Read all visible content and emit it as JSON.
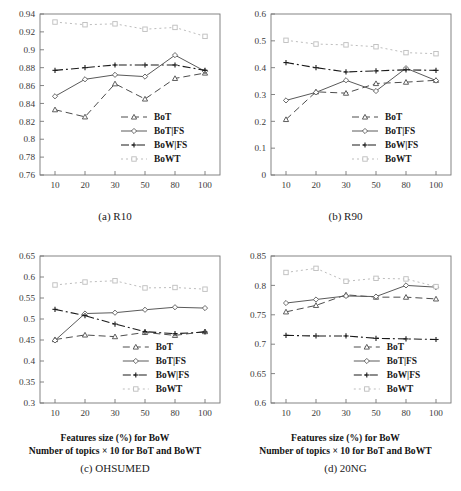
{
  "figure": {
    "panels": [
      {
        "id": "r10",
        "caption": "(a) R10",
        "xtitle_line1": "",
        "xtitle_line2": ""
      },
      {
        "id": "r90",
        "caption": "(b) R90",
        "xtitle_line1": "",
        "xtitle_line2": ""
      },
      {
        "id": "ohsumed",
        "caption": "(c) OHSUMED",
        "xtitle_line1": "Features size (%) for BoW",
        "xtitle_line2": "Number of topics × 10 for BoT and BoWT"
      },
      {
        "id": "20ng",
        "caption": "(d) 20NG",
        "xtitle_line1": "Features size (%) for BoW",
        "xtitle_line2": "Number of topics × 10 for BoT and BoWT"
      }
    ]
  },
  "series_style": {
    "BoT": {
      "color": "#4d4d4d",
      "marker": "triangle",
      "dash": "7,4",
      "width": 1.0
    },
    "BoT|FS": {
      "color": "#5a5a5a",
      "marker": "diamond",
      "dash": "",
      "width": 1.0
    },
    "BoW|FS": {
      "color": "#1a1a1a",
      "marker": "plus",
      "dash": "8,3,2,3",
      "width": 1.1
    },
    "BoWT": {
      "color": "#bdbdbd",
      "marker": "square",
      "dash": "2,3",
      "width": 1.0
    }
  },
  "legend": {
    "entries": [
      "BoT",
      "BoT|FS",
      "BoW|FS",
      "BoWT"
    ]
  },
  "chart_data": [
    {
      "type": "line",
      "title": "(a) R10",
      "xlabel": "",
      "ylabel": "",
      "categories": [
        "10",
        "20",
        "30",
        "50",
        "80",
        "100"
      ],
      "x": [
        10,
        20,
        30,
        50,
        80,
        100
      ],
      "xticklabels": [
        "10",
        "20",
        "30",
        "50",
        "80",
        "100"
      ],
      "yticklabels": [
        "0.76",
        "0.78",
        "0.8",
        "0.82",
        "0.84",
        "0.86",
        "0.88",
        "0.9",
        "0.92",
        "0.94"
      ],
      "ylim": [
        0.76,
        0.94
      ],
      "ytick_step": 0.02,
      "grid": false,
      "legend_position": "lower-right-inside",
      "series": [
        {
          "name": "BoT",
          "values": [
            0.833,
            0.825,
            0.862,
            0.845,
            0.868,
            0.874
          ]
        },
        {
          "name": "BoT|FS",
          "values": [
            0.848,
            0.867,
            0.872,
            0.87,
            0.894,
            0.876
          ]
        },
        {
          "name": "BoW|FS",
          "values": [
            0.877,
            0.88,
            0.883,
            0.883,
            0.883,
            0.877
          ]
        },
        {
          "name": "BoWT",
          "values": [
            0.931,
            0.928,
            0.929,
            0.923,
            0.925,
            0.915
          ]
        }
      ]
    },
    {
      "type": "line",
      "title": "(b) R90",
      "xlabel": "",
      "ylabel": "",
      "categories": [
        "10",
        "20",
        "30",
        "50",
        "80",
        "100"
      ],
      "x": [
        10,
        20,
        30,
        50,
        80,
        100
      ],
      "xticklabels": [
        "10",
        "20",
        "30",
        "50",
        "80",
        "100"
      ],
      "yticklabels": [
        "0",
        "0.1",
        "0.2",
        "0.3",
        "0.4",
        "0.5",
        "0.6"
      ],
      "ylim": [
        0,
        0.6
      ],
      "ytick_step": 0.1,
      "grid": false,
      "legend_position": "lower-right-inside",
      "series": [
        {
          "name": "BoT",
          "values": [
            0.207,
            0.31,
            0.305,
            0.341,
            0.346,
            0.353
          ]
        },
        {
          "name": "BoT|FS",
          "values": [
            0.278,
            0.308,
            0.353,
            0.313,
            0.398,
            0.352
          ]
        },
        {
          "name": "BoW|FS",
          "values": [
            0.419,
            0.4,
            0.384,
            0.388,
            0.392,
            0.39
          ]
        },
        {
          "name": "BoWT",
          "values": [
            0.502,
            0.488,
            0.485,
            0.478,
            0.456,
            0.452
          ]
        }
      ]
    },
    {
      "type": "line",
      "title": "(c) OHSUMED",
      "xlabel": "Features size (%) for BoW / Number of topics × 10 for BoT and BoWT",
      "ylabel": "",
      "categories": [
        "10",
        "20",
        "30",
        "50",
        "80",
        "100"
      ],
      "x": [
        10,
        20,
        30,
        50,
        80,
        100
      ],
      "xticklabels": [
        "10",
        "20",
        "30",
        "50",
        "80",
        "100"
      ],
      "yticklabels": [
        "0.3",
        "0.35",
        "0.4",
        "0.45",
        "0.5",
        "0.55",
        "0.6",
        "0.65"
      ],
      "ylim": [
        0.3,
        0.65
      ],
      "ytick_step": 0.05,
      "grid": false,
      "legend_position": "lower-right-inside",
      "series": [
        {
          "name": "BoT",
          "values": [
            0.451,
            0.462,
            0.458,
            0.468,
            0.461,
            0.47
          ]
        },
        {
          "name": "BoT|FS",
          "values": [
            0.449,
            0.513,
            0.515,
            0.522,
            0.528,
            0.526
          ]
        },
        {
          "name": "BoW|FS",
          "values": [
            0.523,
            0.508,
            0.488,
            0.47,
            0.465,
            0.469
          ]
        },
        {
          "name": "BoWT",
          "values": [
            0.581,
            0.588,
            0.591,
            0.574,
            0.575,
            0.571
          ]
        }
      ]
    },
    {
      "type": "line",
      "title": "(d) 20NG",
      "xlabel": "Features size (%) for BoW / Number of topics × 10 for BoT and BoWT",
      "ylabel": "",
      "categories": [
        "10",
        "20",
        "30",
        "50",
        "80",
        "100"
      ],
      "x": [
        10,
        20,
        30,
        50,
        80,
        100
      ],
      "xticklabels": [
        "10",
        "20",
        "30",
        "50",
        "80",
        "100"
      ],
      "yticklabels": [
        "0.6",
        "0.65",
        "0.7",
        "0.75",
        "0.8",
        "0.85"
      ],
      "ylim": [
        0.6,
        0.85
      ],
      "ytick_step": 0.05,
      "grid": false,
      "legend_position": "lower-right-inside",
      "series": [
        {
          "name": "BoT",
          "values": [
            0.755,
            0.766,
            0.784,
            0.78,
            0.78,
            0.777
          ]
        },
        {
          "name": "BoT|FS",
          "values": [
            0.77,
            0.776,
            0.782,
            0.781,
            0.8,
            0.797
          ]
        },
        {
          "name": "BoW|FS",
          "values": [
            0.715,
            0.714,
            0.714,
            0.71,
            0.709,
            0.708
          ]
        },
        {
          "name": "BoWT",
          "values": [
            0.822,
            0.829,
            0.807,
            0.812,
            0.811,
            0.798
          ]
        }
      ]
    }
  ]
}
